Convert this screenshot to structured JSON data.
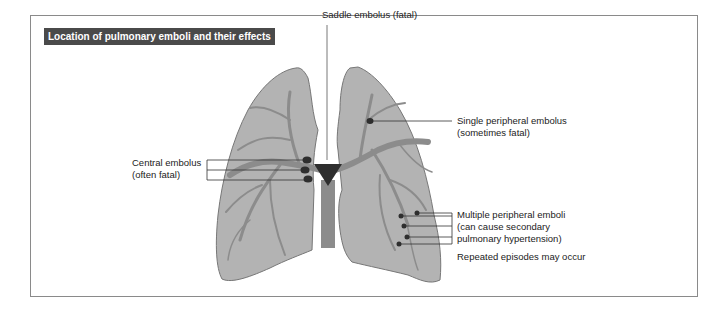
{
  "title": "Location of pulmonary emboli and their effects",
  "labels": {
    "saddle": "Saddle embolus (fatal)",
    "single_line1": "Single peripheral embolus",
    "single_line2": "(sometimes fatal)",
    "central_line1": "Central embolus",
    "central_line2": "(often fatal)",
    "multiple_line1": "Multiple peripheral emboli",
    "multiple_line2": "(can cause secondary",
    "multiple_line3": "pulmonary hypertension)",
    "repeated": "Repeated episodes may occur"
  },
  "colors": {
    "lung_fill": "#b3b3b3",
    "lung_stroke": "#777777",
    "vessel": "#8c8c8c",
    "embolus": "#2e2e2e",
    "title_bg": "#4a4a4a"
  }
}
